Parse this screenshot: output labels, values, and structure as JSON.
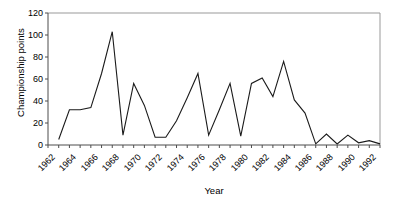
{
  "chart_data": {
    "type": "line",
    "title": "",
    "xlabel": "Year",
    "ylabel": "Championship points",
    "xlim": [
      1962,
      1993
    ],
    "ylim": [
      0,
      120
    ],
    "ytick_values": [
      0,
      20,
      40,
      60,
      80,
      100,
      120
    ],
    "ytick_labels": [
      "0",
      "20",
      "40",
      "60",
      "80",
      "100",
      "120"
    ],
    "xtick_labels": [
      "1962",
      "1964",
      "1966",
      "1968",
      "1970",
      "1972",
      "1974",
      "1976",
      "1978",
      "1980",
      "1982",
      "1984",
      "1986",
      "1988",
      "1990",
      "1992"
    ],
    "xtick_label_values": [
      1962,
      1964,
      1966,
      1968,
      1970,
      1972,
      1974,
      1976,
      1978,
      1980,
      1982,
      1984,
      1986,
      1988,
      1990,
      1992
    ],
    "xtick_minor_values": [
      1962,
      1963,
      1964,
      1965,
      1966,
      1967,
      1968,
      1969,
      1970,
      1971,
      1972,
      1973,
      1974,
      1975,
      1976,
      1977,
      1978,
      1979,
      1980,
      1981,
      1982,
      1983,
      1984,
      1985,
      1986,
      1987,
      1988,
      1989,
      1990,
      1991,
      1992,
      1993
    ],
    "grid": false,
    "legend": false,
    "line_color": "#1a1a1a",
    "axis_color": "#4d4d4d",
    "frame_color": "#999999",
    "background": "#ffffff",
    "x": [
      1963,
      1964,
      1965,
      1966,
      1967,
      1968,
      1969,
      1970,
      1971,
      1972,
      1973,
      1974,
      1975,
      1976,
      1977,
      1978,
      1979,
      1980,
      1981,
      1982,
      1983,
      1984,
      1985,
      1986,
      1987,
      1988,
      1989,
      1990,
      1991,
      1992,
      1993
    ],
    "values": [
      5,
      32,
      32,
      34,
      65,
      103,
      9,
      56,
      36,
      7,
      7,
      22,
      43,
      65,
      9,
      32,
      56,
      8,
      56,
      61,
      44,
      76,
      41,
      29,
      1,
      10,
      1,
      9,
      2,
      4,
      1
    ],
    "series": [
      {
        "name": "Championship points",
        "x": [
          1963,
          1964,
          1965,
          1966,
          1967,
          1968,
          1969,
          1970,
          1971,
          1972,
          1973,
          1974,
          1975,
          1976,
          1977,
          1978,
          1979,
          1980,
          1981,
          1982,
          1983,
          1984,
          1985,
          1986,
          1987,
          1988,
          1989,
          1990,
          1991,
          1992,
          1993
        ],
        "values": [
          5,
          32,
          32,
          34,
          65,
          103,
          9,
          56,
          36,
          7,
          7,
          22,
          43,
          65,
          9,
          32,
          56,
          8,
          56,
          61,
          44,
          76,
          41,
          29,
          1,
          10,
          1,
          9,
          2,
          4,
          1
        ]
      }
    ]
  }
}
